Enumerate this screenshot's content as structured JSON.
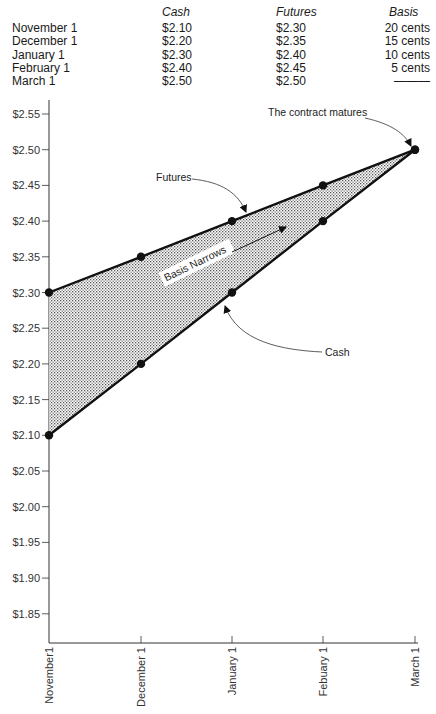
{
  "table": {
    "headers": [
      "",
      "Cash",
      "Futures",
      "Basis"
    ],
    "rows": [
      [
        "November 1",
        "$2.10",
        "$2.30",
        "20 cents"
      ],
      [
        "December 1",
        "$2.20",
        "$2.35",
        "15 cents"
      ],
      [
        "January 1",
        "$2.30",
        "$2.40",
        "10 cents"
      ],
      [
        "February 1",
        "$2.40",
        "$2.45",
        "5 cents"
      ],
      [
        "March 1",
        "$2.50",
        "$2.50",
        "———"
      ]
    ]
  },
  "chart_data": {
    "type": "line",
    "title": "",
    "xlabel": "",
    "ylabel": "",
    "categories": [
      "November1",
      "December 1",
      "January 1",
      "Febuary 1",
      "March 1"
    ],
    "series": [
      {
        "name": "Futures",
        "values": [
          2.3,
          2.35,
          2.4,
          2.45,
          2.5
        ]
      },
      {
        "name": "Cash",
        "values": [
          2.1,
          2.2,
          2.3,
          2.4,
          2.5
        ]
      }
    ],
    "y_ticks": [
      "$2.55",
      "$2.50",
      "$2.45",
      "$2.40",
      "$2.35",
      "$2.30",
      "$2.25",
      "$2.20",
      "$2.15",
      "$2.10",
      "$2.05",
      "$2.00",
      "$1.95",
      "$1.90",
      "$1.85"
    ],
    "ylim": [
      1.81,
      2.57
    ],
    "grid": false,
    "fill_between": "Futures-Cash (basis, stippled)",
    "annotations": [
      {
        "text": "The contract matures",
        "target": "March 1 / $2.50"
      },
      {
        "text": "Futures",
        "target": "Futures line near January 1"
      },
      {
        "text": "Cash",
        "target": "Cash line near January 1"
      },
      {
        "text": "Basis Narrows",
        "target": "arrow pointing up-right within shaded area"
      }
    ]
  }
}
